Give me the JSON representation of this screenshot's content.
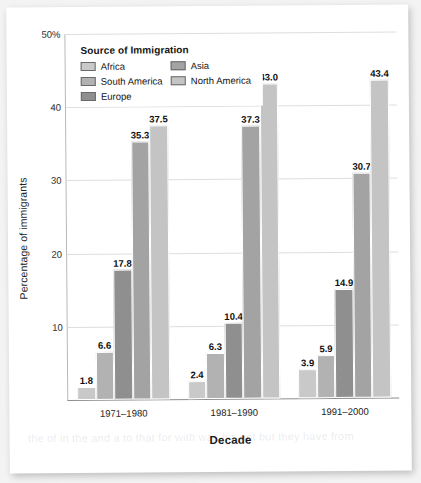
{
  "chart_data": {
    "type": "bar",
    "title": "",
    "xlabel": "Decade",
    "ylabel": "Percentage of immigrants",
    "categories": [
      "1971–1980",
      "1981–1990",
      "1991–2000"
    ],
    "series": [
      {
        "name": "Africa",
        "color": "#c9c9c9",
        "values": [
          1.8,
          2.4,
          3.9
        ]
      },
      {
        "name": "South America",
        "color": "#b2b2b2",
        "values": [
          6.6,
          6.3,
          5.9
        ]
      },
      {
        "name": "Europe",
        "color": "#8f8f8f",
        "values": [
          17.8,
          10.4,
          14.9
        ]
      },
      {
        "name": "Asia",
        "color": "#a3a3a3",
        "values": [
          35.3,
          37.3,
          30.7
        ]
      },
      {
        "name": "North America",
        "color": "#c4c4c4",
        "values": [
          37.5,
          43.0,
          43.4
        ]
      }
    ],
    "ylim": [
      0,
      50
    ],
    "yticks": [
      10,
      20,
      30,
      40,
      50
    ],
    "ytick_labels": [
      "10",
      "20",
      "30",
      "40",
      "50%"
    ],
    "grid": true,
    "legend": {
      "title": "Source of Immigration",
      "position": "inside-top-left",
      "columns": 2
    },
    "bar_labels": true
  },
  "ghost_text": "the of in the and a to that for with was his not but they have from"
}
